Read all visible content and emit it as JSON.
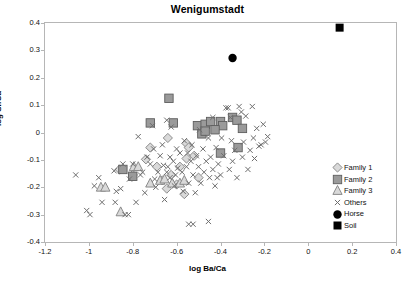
{
  "chart_data": {
    "type": "scatter",
    "title": "Wenigumstadt",
    "xlabel": "log Ba/Ca",
    "ylabel": "log Sr/Ca",
    "xlim": [
      -1.2,
      0.4
    ],
    "ylim": [
      -0.4,
      0.4
    ],
    "xticks": [
      "-1.2",
      "-1",
      "-0.8",
      "-0.6",
      "-0.4",
      "-0.2",
      "0",
      "0.2",
      "0.4"
    ],
    "xtick_values": [
      -1.2,
      -1.0,
      -0.8,
      -0.6,
      -0.4,
      -0.2,
      0,
      0.2,
      0.4
    ],
    "yticks": [
      "0.4",
      "0.3",
      "0.2",
      "0.1",
      "0",
      "-0.1",
      "-0.2",
      "-0.3",
      "-0.4"
    ],
    "ytick_values": [
      0.4,
      0.3,
      0.2,
      0.1,
      0,
      -0.1,
      -0.2,
      -0.3,
      -0.4
    ],
    "grid": false,
    "legend_position": "bottom-right",
    "series": [
      {
        "name": "Family 1",
        "marker": "diamond-open",
        "color": "#d9d9d9",
        "edge": "#808080",
        "points": [
          [
            -0.86,
            -0.135
          ],
          [
            -0.8,
            -0.155
          ],
          [
            -0.74,
            -0.098
          ],
          [
            -0.69,
            -0.125
          ],
          [
            -0.665,
            -0.175
          ],
          [
            -0.645,
            -0.205
          ],
          [
            -0.625,
            -0.155
          ],
          [
            -0.6,
            -0.19
          ],
          [
            -0.585,
            -0.125
          ],
          [
            -0.72,
            -0.055
          ],
          [
            -0.565,
            -0.225
          ],
          [
            -0.555,
            -0.04
          ],
          [
            -0.5,
            -0.165
          ],
          [
            -0.545,
            -0.055
          ],
          [
            -0.52,
            -0.085
          ],
          [
            -0.64,
            -0.02
          ],
          [
            -0.555,
            -0.095
          ]
        ]
      },
      {
        "name": "Family 2",
        "marker": "square-filled",
        "color": "#9a9a9a",
        "edge": "#6e6e6e",
        "points": [
          [
            -0.635,
            0.125
          ],
          [
            -0.72,
            0.035
          ],
          [
            -0.615,
            0.035
          ],
          [
            -0.505,
            0.025
          ],
          [
            -0.47,
            0.03
          ],
          [
            -0.445,
            0.04
          ],
          [
            -0.4,
            0.04
          ],
          [
            -0.39,
            0.025
          ],
          [
            -0.345,
            0.055
          ],
          [
            -0.325,
            0.045
          ],
          [
            -0.3,
            0.015
          ],
          [
            -0.32,
            -0.055
          ],
          [
            -0.4,
            -0.075
          ],
          [
            -0.485,
            -0.005
          ],
          [
            -0.845,
            -0.135
          ],
          [
            -0.8,
            -0.16
          ],
          [
            -0.47,
            0.005
          ],
          [
            -0.425,
            0.01
          ]
        ]
      },
      {
        "name": "Family 3",
        "marker": "triangle-open",
        "color": "#d9d9d9",
        "edge": "#808080",
        "points": [
          [
            -0.945,
            -0.2
          ],
          [
            -0.925,
            -0.2
          ],
          [
            -0.795,
            -0.125
          ],
          [
            -0.775,
            -0.125
          ],
          [
            -0.855,
            -0.29
          ],
          [
            -0.72,
            -0.185
          ],
          [
            -0.675,
            -0.175
          ],
          [
            -0.655,
            -0.17
          ],
          [
            -0.62,
            -0.185
          ],
          [
            -0.585,
            -0.185
          ],
          [
            -0.565,
            -0.175
          ]
        ]
      },
      {
        "name": "Others",
        "marker": "cross",
        "color": "#6e6e6e",
        "points": [
          [
            -1.06,
            -0.155
          ],
          [
            -1.01,
            -0.285
          ],
          [
            -0.995,
            -0.3
          ],
          [
            -0.975,
            -0.195
          ],
          [
            -0.955,
            -0.165
          ],
          [
            -0.94,
            -0.255
          ],
          [
            -0.885,
            -0.14
          ],
          [
            -0.875,
            -0.215
          ],
          [
            -0.855,
            -0.205
          ],
          [
            -0.845,
            -0.115
          ],
          [
            -0.835,
            -0.3
          ],
          [
            -0.82,
            -0.3
          ],
          [
            -0.815,
            -0.17
          ],
          [
            -0.8,
            -0.115
          ],
          [
            -0.785,
            -0.255
          ],
          [
            -0.775,
            -0.015
          ],
          [
            -0.765,
            -0.155
          ],
          [
            -0.755,
            -0.145
          ],
          [
            -0.745,
            -0.22
          ],
          [
            -0.735,
            -0.09
          ],
          [
            -0.72,
            -0.115
          ],
          [
            -0.71,
            0.025
          ],
          [
            -0.7,
            -0.17
          ],
          [
            -0.695,
            -0.2
          ],
          [
            -0.685,
            -0.145
          ],
          [
            -0.675,
            -0.085
          ],
          [
            -0.665,
            -0.045
          ],
          [
            -0.655,
            -0.245
          ],
          [
            -0.645,
            0.045
          ],
          [
            -0.64,
            -0.125
          ],
          [
            -0.63,
            -0.165
          ],
          [
            -0.625,
            0.02
          ],
          [
            -0.615,
            -0.105
          ],
          [
            -0.61,
            -0.195
          ],
          [
            -0.6,
            -0.06
          ],
          [
            -0.595,
            -0.13
          ],
          [
            -0.585,
            -0.075
          ],
          [
            -0.575,
            -0.145
          ],
          [
            -0.57,
            -0.215
          ],
          [
            -0.565,
            -0.03
          ],
          [
            -0.555,
            -0.125
          ],
          [
            -0.55,
            -0.075
          ],
          [
            -0.545,
            -0.185
          ],
          [
            -0.535,
            -0.105
          ],
          [
            -0.53,
            -0.045
          ],
          [
            -0.525,
            -0.155
          ],
          [
            -0.515,
            -0.22
          ],
          [
            -0.51,
            -0.085
          ],
          [
            -0.5,
            -0.125
          ],
          [
            -0.495,
            0.01
          ],
          [
            -0.49,
            -0.185
          ],
          [
            -0.48,
            -0.06
          ],
          [
            -0.475,
            -0.145
          ],
          [
            -0.465,
            -0.105
          ],
          [
            -0.455,
            -0.02
          ],
          [
            -0.45,
            -0.165
          ],
          [
            -0.445,
            -0.09
          ],
          [
            -0.435,
            -0.135
          ],
          [
            -0.425,
            -0.195
          ],
          [
            -0.42,
            -0.055
          ],
          [
            -0.41,
            -0.115
          ],
          [
            -0.4,
            -0.155
          ],
          [
            -0.395,
            -0.02
          ],
          [
            -0.385,
            -0.085
          ],
          [
            -0.375,
            0.09
          ],
          [
            -0.365,
            0.09
          ],
          [
            -0.36,
            -0.135
          ],
          [
            -0.355,
            0.055
          ],
          [
            -0.35,
            -0.03
          ],
          [
            -0.345,
            -0.105
          ],
          [
            -0.335,
            -0.065
          ],
          [
            -0.325,
            -0.165
          ],
          [
            -0.315,
            0.095
          ],
          [
            -0.305,
            0.075
          ],
          [
            -0.3,
            -0.09
          ],
          [
            -0.295,
            -0.035
          ],
          [
            -0.285,
            0.06
          ],
          [
            -0.275,
            -0.135
          ],
          [
            -0.265,
            -0.065
          ],
          [
            -0.255,
            0.095
          ],
          [
            -0.25,
            -0.02
          ],
          [
            -0.245,
            -0.095
          ],
          [
            -0.235,
            0.015
          ],
          [
            -0.225,
            -0.05
          ],
          [
            -0.215,
            -0.045
          ],
          [
            -0.205,
            0.03
          ],
          [
            -0.195,
            -0.035
          ],
          [
            -0.185,
            -0.015
          ],
          [
            -0.545,
            -0.335
          ],
          [
            -0.525,
            -0.335
          ],
          [
            -0.455,
            -0.325
          ],
          [
            -0.645,
            -0.145
          ],
          [
            -0.66,
            -0.12
          ],
          [
            -0.63,
            -0.09
          ],
          [
            -0.605,
            -0.155
          ],
          [
            -0.88,
            -0.255
          ],
          [
            -0.705,
            -0.06
          ],
          [
            -0.435,
            0.055
          ],
          [
            -0.415,
            -0.165
          ]
        ]
      },
      {
        "name": "Horse",
        "marker": "circle-filled",
        "color": "#000000",
        "points": [
          [
            -0.345,
            0.272
          ]
        ]
      },
      {
        "name": "Soil",
        "marker": "square-filled-black",
        "color": "#000000",
        "points": [
          [
            0.143,
            0.383
          ]
        ]
      }
    ]
  },
  "legend": {
    "items": [
      {
        "label": "Family 1",
        "marker": "diamond-open"
      },
      {
        "label": "Family 2",
        "marker": "square-filled"
      },
      {
        "label": "Family 3",
        "marker": "triangle-open"
      },
      {
        "label": "Others",
        "marker": "cross"
      },
      {
        "label": "Horse",
        "marker": "circle-filled"
      },
      {
        "label": "Soil",
        "marker": "square-filled-black"
      }
    ]
  },
  "colors": {
    "frame": "#b6b6b6",
    "marker_fill": "#d9d9d9",
    "marker_edge": "#808080",
    "family2_fill": "#9a9a9a",
    "others": "#6e6e6e",
    "black": "#000000"
  }
}
